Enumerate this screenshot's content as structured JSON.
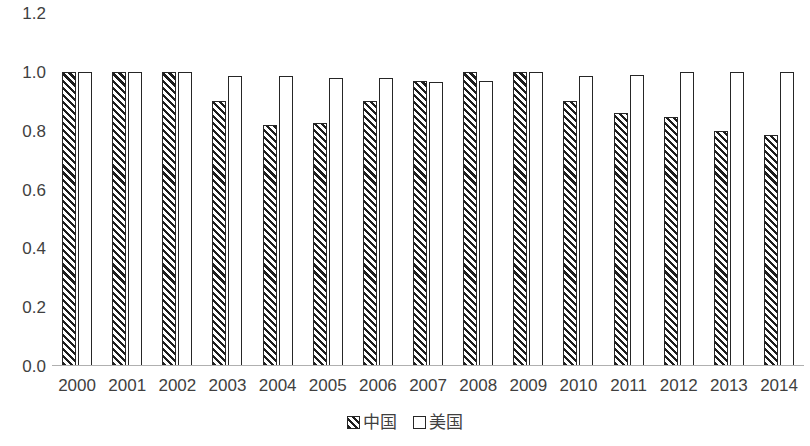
{
  "chart_data": {
    "type": "bar",
    "title": "",
    "subtitle": "",
    "xlabel": "",
    "ylabel": "",
    "ylim": [
      0.0,
      1.2
    ],
    "yticks": [
      "1.2",
      "1.0",
      "0.8",
      "0.6",
      "0.4",
      "0.2",
      "0.0"
    ],
    "ytick_values": [
      1.2,
      1.0,
      0.8,
      0.6,
      0.4,
      0.2,
      0.0
    ],
    "grid": false,
    "legend_position": "bottom",
    "categories": [
      "2000",
      "2001",
      "2002",
      "2003",
      "2004",
      "2005",
      "2006",
      "2007",
      "2008",
      "2009",
      "2010",
      "2011",
      "2012",
      "2013",
      "2014"
    ],
    "series": [
      {
        "name": "中国",
        "style": "hatched",
        "values": [
          1.0,
          1.0,
          1.0,
          0.9,
          0.82,
          0.825,
          0.9,
          0.97,
          1.0,
          1.0,
          0.9,
          0.86,
          0.845,
          0.8,
          0.785
        ]
      },
      {
        "name": "美国",
        "style": "open",
        "values": [
          1.0,
          1.0,
          1.0,
          0.985,
          0.985,
          0.98,
          0.98,
          0.965,
          0.97,
          1.0,
          0.985,
          0.99,
          1.0,
          1.0,
          1.0
        ]
      }
    ]
  },
  "legend": {
    "entries": [
      {
        "label": "中国",
        "swatch": "hatched-swatch-icon"
      },
      {
        "label": "美国",
        "swatch": "open-swatch-icon"
      }
    ]
  }
}
